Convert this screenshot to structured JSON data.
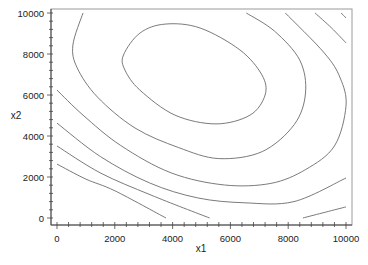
{
  "chart_data": {
    "type": "contour",
    "title": "",
    "xlabel": "x1",
    "ylabel": "x2",
    "xlim": [
      0,
      10000
    ],
    "ylim": [
      0,
      10000
    ],
    "xticks": [
      0,
      2000,
      4000,
      6000,
      8000,
      10000
    ],
    "yticks": [
      0,
      2000,
      4000,
      6000,
      8000,
      10000
    ],
    "xtick_labels": [
      "0",
      "2000",
      "4000",
      "6000",
      "8000",
      "10000"
    ],
    "ytick_labels": [
      "0",
      "2000",
      "4000",
      "6000",
      "8000",
      "10000"
    ],
    "minor_tick_step": 400,
    "grid": false,
    "legend": null,
    "line_color": "#6b6b6b",
    "contours": [
      {
        "name": "level-1",
        "closed": true,
        "points": [
          [
            2300,
            7950
          ],
          [
            2870,
            9020
          ],
          [
            3740,
            9460
          ],
          [
            4950,
            9270
          ],
          [
            6330,
            8200
          ],
          [
            7090,
            6980
          ],
          [
            7200,
            6000
          ],
          [
            6680,
            5020
          ],
          [
            5500,
            4590
          ],
          [
            4080,
            5020
          ],
          [
            2870,
            6240
          ],
          [
            2350,
            7220
          ]
        ]
      },
      {
        "name": "level-2",
        "closed": false,
        "points": [
          [
            900,
            10000
          ],
          [
            550,
            8440
          ],
          [
            700,
            7320
          ],
          [
            1400,
            5900
          ],
          [
            2700,
            4390
          ],
          [
            4200,
            3440
          ],
          [
            5600,
            2900
          ],
          [
            7100,
            3240
          ],
          [
            8210,
            4560
          ],
          [
            8600,
            6100
          ],
          [
            8400,
            7700
          ],
          [
            7530,
            9110
          ],
          [
            6550,
            10000
          ]
        ]
      },
      {
        "name": "level-3",
        "closed": false,
        "points": [
          [
            0,
            6240
          ],
          [
            900,
            5020
          ],
          [
            2200,
            3540
          ],
          [
            3950,
            2200
          ],
          [
            5800,
            1610
          ],
          [
            7400,
            1690
          ],
          [
            8600,
            2360
          ],
          [
            9600,
            3510
          ],
          [
            10000,
            5460
          ],
          [
            9800,
            6830
          ],
          [
            9250,
            8050
          ],
          [
            7900,
            10000
          ]
        ]
      },
      {
        "name": "level-4",
        "closed": false,
        "points": [
          [
            0,
            4630
          ],
          [
            1500,
            3000
          ],
          [
            3200,
            1710
          ],
          [
            4870,
            980
          ],
          [
            6500,
            740
          ],
          [
            8200,
            800
          ],
          [
            10000,
            1950
          ]
        ]
      },
      {
        "name": "level-4-upper",
        "closed": false,
        "points": [
          [
            8930,
            10000
          ],
          [
            9500,
            9270
          ],
          [
            10000,
            8540
          ]
        ]
      },
      {
        "name": "level-5",
        "closed": false,
        "points": [
          [
            0,
            3510
          ],
          [
            1500,
            2200
          ],
          [
            3250,
            1120
          ],
          [
            5280,
            0
          ]
        ]
      },
      {
        "name": "level-5-right",
        "closed": false,
        "points": [
          [
            8510,
            0
          ],
          [
            9300,
            290
          ],
          [
            10000,
            540
          ]
        ]
      },
      {
        "name": "level-5-upper",
        "closed": false,
        "points": [
          [
            9830,
            10000
          ],
          [
            10000,
            9760
          ]
        ]
      },
      {
        "name": "level-6",
        "closed": false,
        "points": [
          [
            0,
            2630
          ],
          [
            1000,
            1900
          ],
          [
            2010,
            1320
          ],
          [
            3770,
            0
          ]
        ]
      }
    ]
  }
}
